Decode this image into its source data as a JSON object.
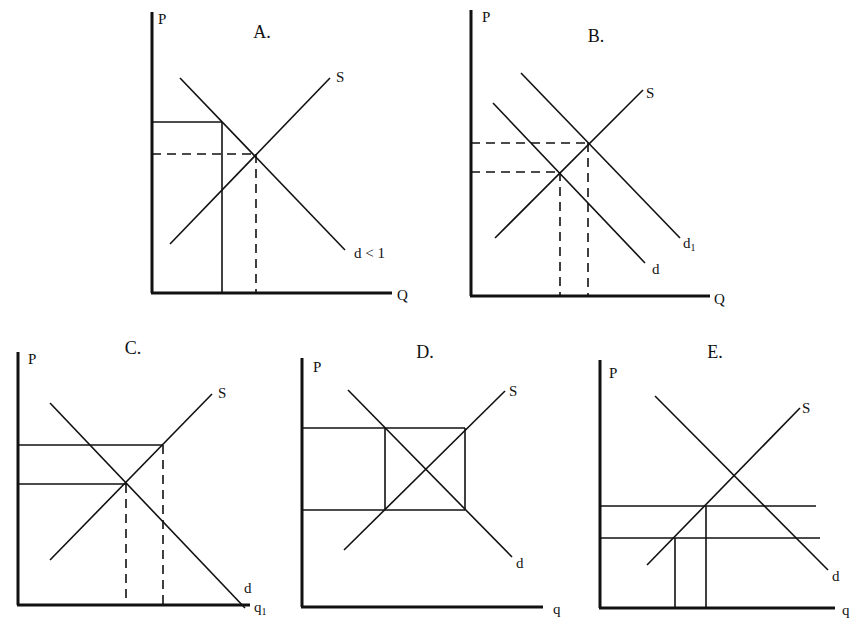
{
  "figure": {
    "background": "#ffffff",
    "ink": "#111111"
  },
  "chart_data": [
    {
      "id": "A",
      "type": "line",
      "title": "A.",
      "ylabel": "P",
      "xlabel": "Q",
      "origin": [
        152,
        293
      ],
      "axes": {
        "y_top": 12,
        "x_right": 392
      },
      "title_pos": [
        262,
        38
      ],
      "ylabel_pos": [
        158,
        24
      ],
      "xlabel_pos": [
        397,
        300
      ],
      "curves": [
        {
          "name": "d < 1",
          "label": "d < 1",
          "from": [
            180,
            78
          ],
          "to": [
            345,
            250
          ],
          "label_pos": [
            354,
            258
          ]
        },
        {
          "name": "S",
          "label": "S",
          "from": [
            170,
            244
          ],
          "to": [
            330,
            78
          ],
          "label_pos": [
            336,
            82
          ]
        }
      ],
      "guides": [
        {
          "style": "solid",
          "from": [
            152,
            122
          ],
          "to": [
            222,
            122
          ]
        },
        {
          "style": "solid",
          "from": [
            222,
            122
          ],
          "to": [
            222,
            293
          ]
        },
        {
          "style": "dashed",
          "from": [
            152,
            154
          ],
          "to": [
            256,
            154
          ]
        },
        {
          "style": "dashed",
          "from": [
            256,
            154
          ],
          "to": [
            256,
            293
          ]
        }
      ]
    },
    {
      "id": "B",
      "type": "line",
      "title": "B.",
      "ylabel": "P",
      "xlabel": "Q",
      "origin": [
        471,
        296
      ],
      "axes": {
        "y_top": 10,
        "x_right": 710
      },
      "title_pos": [
        596,
        42
      ],
      "ylabel_pos": [
        482,
        22
      ],
      "xlabel_pos": [
        714,
        304
      ],
      "curves": [
        {
          "name": "d",
          "label": "d",
          "from": [
            493,
            103
          ],
          "to": [
            645,
            263
          ],
          "label_pos": [
            652,
            274
          ]
        },
        {
          "name": "d1",
          "label": "d",
          "sub": "1",
          "from": [
            521,
            73
          ],
          "to": [
            680,
            238
          ],
          "label_pos": [
            683,
            248
          ]
        },
        {
          "name": "S",
          "label": "S",
          "from": [
            495,
            238
          ],
          "to": [
            643,
            90
          ],
          "label_pos": [
            646,
            98
          ]
        }
      ],
      "guides": [
        {
          "style": "dashed",
          "from": [
            471,
            143
          ],
          "to": [
            588,
            143
          ]
        },
        {
          "style": "dashed",
          "from": [
            471,
            172
          ],
          "to": [
            560,
            172
          ]
        },
        {
          "style": "dashed",
          "from": [
            560,
            172
          ],
          "to": [
            560,
            296
          ]
        },
        {
          "style": "dashed",
          "from": [
            588,
            143
          ],
          "to": [
            588,
            296
          ]
        }
      ]
    },
    {
      "id": "C",
      "type": "line",
      "title": "C.",
      "ylabel": "P",
      "xlabel": "q1",
      "origin": [
        18,
        605
      ],
      "axes": {
        "y_top": 352,
        "x_right": 250
      },
      "title_pos": [
        133,
        354
      ],
      "ylabel_pos": [
        28,
        364
      ],
      "xlabel_pos": [
        254,
        612
      ],
      "curves": [
        {
          "name": "d",
          "label": "d",
          "from": [
            50,
            403
          ],
          "to": [
            245,
            608
          ],
          "label_pos": [
            244,
            593
          ]
        },
        {
          "name": "S",
          "label": "S",
          "from": [
            50,
            560
          ],
          "to": [
            212,
            394
          ],
          "label_pos": [
            218,
            398
          ]
        }
      ],
      "guides": [
        {
          "style": "solid",
          "from": [
            18,
            445
          ],
          "to": [
            163,
            445
          ]
        },
        {
          "style": "solid",
          "from": [
            18,
            484
          ],
          "to": [
            126,
            484
          ]
        },
        {
          "style": "dashed",
          "from": [
            126,
            484
          ],
          "to": [
            126,
            605
          ]
        },
        {
          "style": "dashed",
          "from": [
            163,
            445
          ],
          "to": [
            163,
            605
          ]
        }
      ]
    },
    {
      "id": "D",
      "type": "line",
      "title": "D.",
      "ylabel": "P",
      "xlabel": "q",
      "origin": [
        302,
        607
      ],
      "axes": {
        "y_top": 358,
        "x_right": 543
      },
      "title_pos": [
        425,
        358
      ],
      "ylabel_pos": [
        313,
        372
      ],
      "xlabel_pos": [
        553,
        614
      ],
      "curves": [
        {
          "name": "d",
          "label": "d",
          "from": [
            348,
            390
          ],
          "to": [
            512,
            557
          ],
          "label_pos": [
            516,
            568
          ]
        },
        {
          "name": "S",
          "label": "S",
          "from": [
            344,
            550
          ],
          "to": [
            505,
            391
          ],
          "label_pos": [
            509,
            396
          ]
        }
      ],
      "guides": [
        {
          "style": "solid",
          "from": [
            302,
            428
          ],
          "to": [
            465,
            428
          ]
        },
        {
          "style": "solid",
          "from": [
            302,
            510
          ],
          "to": [
            465,
            510
          ]
        },
        {
          "style": "solid",
          "from": [
            385,
            428
          ],
          "to": [
            385,
            510
          ]
        },
        {
          "style": "solid",
          "from": [
            465,
            428
          ],
          "to": [
            465,
            510
          ]
        }
      ]
    },
    {
      "id": "E",
      "type": "line",
      "title": "E.",
      "ylabel": "P",
      "xlabel": "q",
      "origin": [
        600,
        608
      ],
      "axes": {
        "y_top": 360,
        "x_right": 835
      },
      "title_pos": [
        715,
        358
      ],
      "ylabel_pos": [
        609,
        378
      ],
      "xlabel_pos": [
        842,
        615
      ],
      "curves": [
        {
          "name": "d",
          "label": "d",
          "from": [
            655,
            396
          ],
          "to": [
            828,
            570
          ],
          "label_pos": [
            832,
            581
          ]
        },
        {
          "name": "S",
          "label": "S",
          "from": [
            647,
            565
          ],
          "to": [
            800,
            408
          ],
          "label_pos": [
            802,
            413
          ]
        }
      ],
      "guides": [
        {
          "style": "solid",
          "from": [
            600,
            506
          ],
          "to": [
            816,
            506
          ]
        },
        {
          "style": "solid",
          "from": [
            600,
            538
          ],
          "to": [
            820,
            538
          ]
        },
        {
          "style": "solid",
          "from": [
            675,
            538
          ],
          "to": [
            675,
            608
          ]
        },
        {
          "style": "solid",
          "from": [
            706,
            506
          ],
          "to": [
            706,
            608
          ]
        }
      ]
    }
  ]
}
